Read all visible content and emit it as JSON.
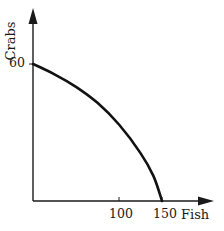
{
  "chart_data": {
    "type": "line",
    "title": "",
    "xlabel": "Fish",
    "ylabel": "Crabs",
    "xlim": [
      0,
      170
    ],
    "ylim": [
      0,
      70
    ],
    "x_ticks": [
      100,
      150
    ],
    "y_ticks": [
      60
    ],
    "grid": false,
    "legend": null,
    "series": [
      {
        "name": "Production possibilities frontier",
        "shape": "concave",
        "x": [
          0,
          25,
          50,
          75,
          100,
          125,
          140,
          150
        ],
        "y": [
          60,
          55.5,
          50,
          43,
          33.5,
          21,
          11,
          0
        ]
      }
    ]
  },
  "labels": {
    "ylabel": "Crabs",
    "xlabel": "Fish",
    "ytick_60": "60",
    "xtick_100": "100",
    "xtick_150": "150"
  },
  "colors": {
    "axis": "#1a1a1a",
    "curve": "#111111",
    "background": "#ffffff"
  }
}
